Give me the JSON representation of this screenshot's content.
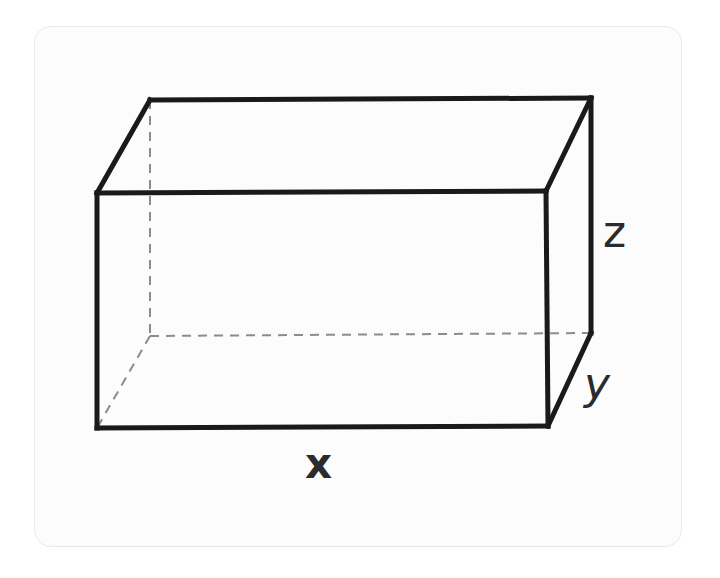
{
  "figure": {
    "kind": "rectangular-prism-diagram",
    "background_color": "#ffffff",
    "card": {
      "fill_color": "#fcfcfc",
      "border_color": "#e9e9e9",
      "corner_radius": 17
    },
    "solid_line_color": "#1a1a1a",
    "solid_line_width": 5,
    "hidden_line_color": "#8c8c8c",
    "hidden_line_width": 2,
    "hidden_line_dash": "9 7"
  },
  "labels": {
    "x": "x",
    "y": "y",
    "z": "z"
  },
  "chart_data": {
    "type": "diagram",
    "subtype": "3d-rectangular-prism-wireframe",
    "projection": "oblique",
    "edge_labels": [
      {
        "name": "x",
        "text": "x",
        "edge": "front-bottom",
        "style": "bold",
        "position": [
          320,
          465
        ]
      },
      {
        "name": "y",
        "text": "y",
        "edge": "right-depth",
        "style": "italic",
        "position": [
          598,
          385
        ]
      },
      {
        "name": "z",
        "text": "z",
        "edge": "right-vertical",
        "style": "regular",
        "position": [
          614,
          232
        ]
      }
    ],
    "vertices": {
      "front_top_left": [
        97,
        193
      ],
      "front_top_right": [
        546,
        191
      ],
      "front_bottom_right": [
        548,
        426
      ],
      "front_bottom_left": [
        97,
        428
      ],
      "back_top_left": [
        150,
        100
      ],
      "back_top_right": [
        591,
        98
      ],
      "back_bottom_right": [
        591,
        333
      ],
      "back_bottom_left": [
        150,
        336
      ]
    },
    "solid_edges": [
      [
        "front_top_left",
        "front_top_right"
      ],
      [
        "front_top_right",
        "front_bottom_right"
      ],
      [
        "front_bottom_right",
        "front_bottom_left"
      ],
      [
        "front_bottom_left",
        "front_top_left"
      ],
      [
        "back_top_left",
        "back_top_right"
      ],
      [
        "back_top_right",
        "back_bottom_right"
      ],
      [
        "front_top_left",
        "back_top_left"
      ],
      [
        "front_top_right",
        "back_top_right"
      ],
      [
        "front_bottom_right",
        "back_bottom_right"
      ]
    ],
    "hidden_edges": [
      [
        "back_top_left",
        "back_bottom_left"
      ],
      [
        "back_bottom_left",
        "back_bottom_right"
      ],
      [
        "back_bottom_left",
        "front_bottom_left"
      ]
    ],
    "grid": false,
    "legend": false
  }
}
